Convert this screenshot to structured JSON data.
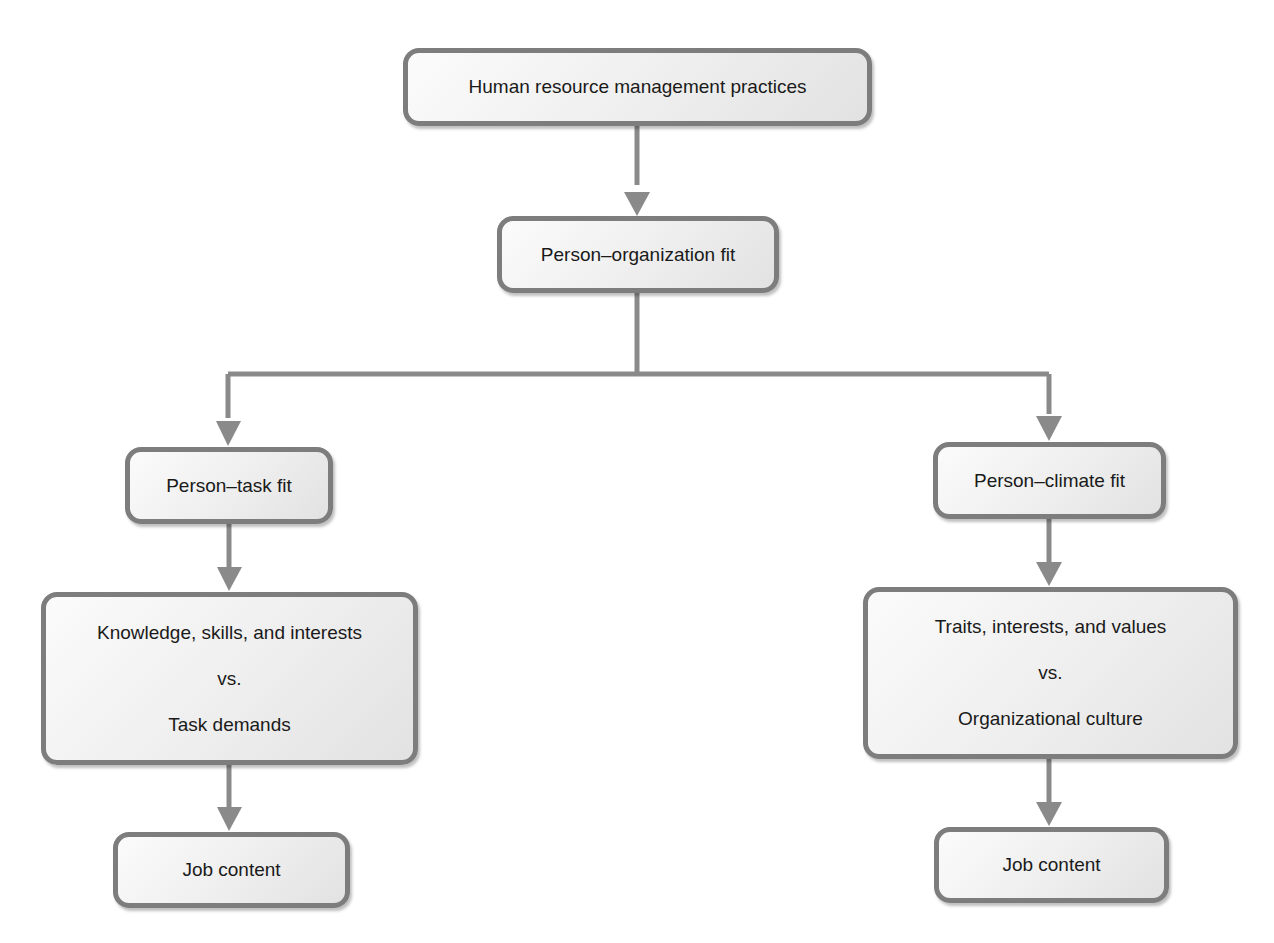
{
  "diagram": {
    "type": "flowchart",
    "colors": {
      "box_border": "#7d7d7d",
      "box_fill": "#eeeeee",
      "connector": "#8a8a8a",
      "text": "#1a1a1a"
    },
    "nodes": {
      "hrm": {
        "label": "Human resource management practices"
      },
      "po_fit": {
        "label": "Person–organization fit"
      },
      "pt_fit": {
        "label": "Person–task fit"
      },
      "pc_fit": {
        "label": "Person–climate fit"
      },
      "pt_compare": {
        "lines": [
          "Knowledge, skills, and interests",
          "vs.",
          "Task demands"
        ]
      },
      "pc_compare": {
        "lines": [
          "Traits, interests, and values",
          "vs.",
          "Organizational culture"
        ]
      },
      "left_outcome": {
        "label": "Job content"
      },
      "right_outcome": {
        "label": "Job content"
      }
    },
    "edges": [
      {
        "from": "hrm",
        "to": "po_fit"
      },
      {
        "from": "po_fit",
        "to": "pt_fit"
      },
      {
        "from": "po_fit",
        "to": "pc_fit"
      },
      {
        "from": "pt_fit",
        "to": "pt_compare"
      },
      {
        "from": "pc_fit",
        "to": "pc_compare"
      },
      {
        "from": "pt_compare",
        "to": "left_outcome"
      },
      {
        "from": "pc_compare",
        "to": "right_outcome"
      }
    ]
  }
}
